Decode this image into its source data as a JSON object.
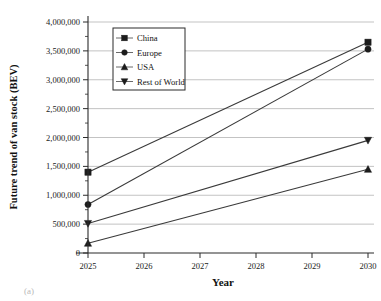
{
  "chart_data": {
    "type": "line",
    "title": "",
    "xlabel": "Year",
    "ylabel": "Future trend of van stock (BEV)",
    "x": [
      2025,
      2030
    ],
    "xticklabels": [
      "2025",
      "2026",
      "2027",
      "2028",
      "2029",
      "2030"
    ],
    "xlim": [
      2025,
      2030
    ],
    "ylim": [
      0,
      4000000
    ],
    "yticklabels": [
      "0",
      "500,000",
      "1,000,000",
      "1,500,000",
      "2,000,000",
      "2,500,000",
      "3,000,000",
      "3,500,000",
      "4,000,000"
    ],
    "yticks": [
      0,
      500000,
      1000000,
      1500000,
      2000000,
      2500000,
      3000000,
      3500000,
      4000000
    ],
    "grid": "horizontal",
    "legend_position": "upper-left",
    "series": [
      {
        "name": "China",
        "marker": "square",
        "values": [
          1400000,
          3650000
        ]
      },
      {
        "name": "Europe",
        "marker": "circle",
        "values": [
          840000,
          3530000
        ]
      },
      {
        "name": "USA",
        "marker": "triangle-up",
        "values": [
          170000,
          1450000
        ]
      },
      {
        "name": "Rest of World",
        "marker": "triangle-down",
        "values": [
          510000,
          1950000
        ]
      }
    ]
  },
  "figure": {
    "caption": "(a)"
  },
  "colors": {
    "line": "#3a3a3a",
    "marker": "#1c1c1c",
    "grid": "#9b9b9b",
    "axis": "#2b2b2b"
  }
}
